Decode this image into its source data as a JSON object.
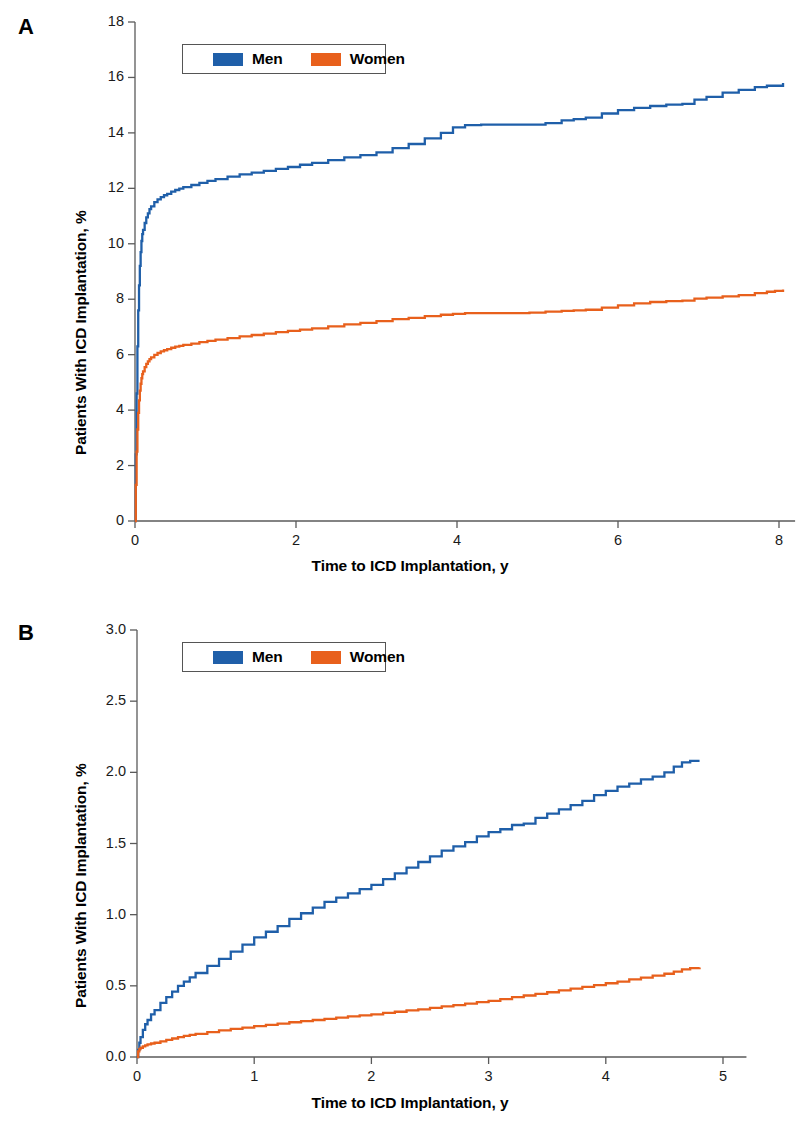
{
  "figure": {
    "background": "#ffffff",
    "series_colors": {
      "men": "#1f5fa9",
      "women": "#e8601c"
    },
    "axis_color": "#5a5a5a"
  },
  "panels": [
    {
      "letter": "A",
      "legend": {
        "entries": [
          {
            "label": "Men",
            "color": "#1f5fa9",
            "swatch_name": "legend-swatch-men"
          },
          {
            "label": "Women",
            "color": "#e8601c",
            "swatch_name": "legend-swatch-women"
          }
        ]
      },
      "chart_data": {
        "type": "line",
        "title": "",
        "xlabel": "Time to ICD Implantation, y",
        "ylabel": "Patients With ICD Implantation, %",
        "xlim": [
          0,
          8.2
        ],
        "ylim": [
          0,
          18
        ],
        "xticks": [
          0,
          2,
          4,
          6,
          8
        ],
        "xtick_labels": [
          "0",
          "2",
          "4",
          "6",
          "8"
        ],
        "yticks": [
          0,
          2,
          4,
          6,
          8,
          10,
          12,
          14,
          16,
          18
        ],
        "ytick_labels": [
          "0",
          "2",
          "4",
          "6",
          "8",
          "10",
          "12",
          "14",
          "16",
          "18"
        ],
        "grid": false,
        "legend_position": "top-center",
        "step_curves": true,
        "series": [
          {
            "name": "Men",
            "color": "#1f5fa9",
            "x": [
              0,
              0.01,
              0.02,
              0.03,
              0.04,
              0.05,
              0.06,
              0.07,
              0.08,
              0.09,
              0.1,
              0.12,
              0.14,
              0.16,
              0.18,
              0.2,
              0.24,
              0.28,
              0.32,
              0.36,
              0.4,
              0.45,
              0.5,
              0.55,
              0.6,
              0.7,
              0.8,
              0.9,
              1.0,
              1.15,
              1.3,
              1.45,
              1.6,
              1.75,
              1.9,
              2.05,
              2.2,
              2.4,
              2.6,
              2.8,
              3.0,
              3.2,
              3.4,
              3.6,
              3.8,
              3.95,
              4.1,
              4.3,
              4.5,
              4.7,
              4.9,
              5.1,
              5.3,
              5.45,
              5.6,
              5.8,
              6.0,
              6.2,
              6.4,
              6.6,
              6.8,
              6.95,
              7.1,
              7.3,
              7.5,
              7.7,
              7.85,
              7.95,
              8.05
            ],
            "y": [
              0,
              2.4,
              4.6,
              6.3,
              7.6,
              8.5,
              9.2,
              9.7,
              10.1,
              10.35,
              10.5,
              10.75,
              10.95,
              11.1,
              11.25,
              11.35,
              11.5,
              11.6,
              11.68,
              11.75,
              11.8,
              11.88,
              11.94,
              11.99,
              12.04,
              12.12,
              12.2,
              12.27,
              12.33,
              12.42,
              12.5,
              12.57,
              12.63,
              12.7,
              12.77,
              12.85,
              12.92,
              13.02,
              13.12,
              13.2,
              13.3,
              13.45,
              13.6,
              13.8,
              14.0,
              14.2,
              14.28,
              14.3,
              14.3,
              14.3,
              14.3,
              14.35,
              14.45,
              14.5,
              14.55,
              14.7,
              14.82,
              14.9,
              14.97,
              15.02,
              15.05,
              15.2,
              15.3,
              15.45,
              15.55,
              15.65,
              15.7,
              15.7,
              15.8
            ]
          },
          {
            "name": "Women",
            "color": "#e8601c",
            "x": [
              0,
              0.01,
              0.02,
              0.03,
              0.04,
              0.05,
              0.06,
              0.07,
              0.08,
              0.09,
              0.1,
              0.12,
              0.14,
              0.16,
              0.18,
              0.2,
              0.24,
              0.28,
              0.32,
              0.36,
              0.4,
              0.45,
              0.5,
              0.55,
              0.6,
              0.7,
              0.8,
              0.9,
              1.0,
              1.15,
              1.3,
              1.45,
              1.6,
              1.75,
              1.9,
              2.05,
              2.2,
              2.4,
              2.6,
              2.8,
              3.0,
              3.2,
              3.4,
              3.6,
              3.8,
              3.95,
              4.1,
              4.3,
              4.5,
              4.7,
              4.9,
              5.1,
              5.3,
              5.45,
              5.6,
              5.8,
              6.0,
              6.2,
              6.4,
              6.6,
              6.8,
              6.95,
              7.1,
              7.3,
              7.5,
              7.7,
              7.85,
              7.95,
              8.05
            ],
            "y": [
              0,
              1.3,
              2.5,
              3.3,
              3.9,
              4.35,
              4.7,
              4.95,
              5.15,
              5.3,
              5.4,
              5.55,
              5.67,
              5.76,
              5.84,
              5.9,
              5.99,
              6.06,
              6.12,
              6.16,
              6.2,
              6.25,
              6.29,
              6.32,
              6.35,
              6.4,
              6.45,
              6.5,
              6.54,
              6.6,
              6.66,
              6.71,
              6.76,
              6.81,
              6.86,
              6.9,
              6.95,
              7.02,
              7.09,
              7.15,
              7.21,
              7.28,
              7.33,
              7.39,
              7.44,
              7.47,
              7.5,
              7.5,
              7.5,
              7.5,
              7.52,
              7.55,
              7.58,
              7.6,
              7.62,
              7.7,
              7.78,
              7.85,
              7.9,
              7.93,
              7.95,
              8.02,
              8.06,
              8.1,
              8.15,
              8.22,
              8.27,
              8.3,
              8.35
            ]
          }
        ]
      }
    },
    {
      "letter": "B",
      "legend": {
        "entries": [
          {
            "label": "Men",
            "color": "#1f5fa9",
            "swatch_name": "legend-swatch-men"
          },
          {
            "label": "Women",
            "color": "#e8601c",
            "swatch_name": "legend-swatch-women"
          }
        ]
      },
      "chart_data": {
        "type": "line",
        "title": "",
        "xlabel": "Time to ICD Implantation, y",
        "ylabel": "Patients With ICD Implantation, %",
        "xlim": [
          0,
          5.2
        ],
        "ylim": [
          0,
          3.0
        ],
        "xticks": [
          0,
          1,
          2,
          3,
          4,
          5
        ],
        "xtick_labels": [
          "0",
          "1",
          "2",
          "3",
          "4",
          "5"
        ],
        "yticks": [
          0.0,
          0.5,
          1.0,
          1.5,
          2.0,
          2.5,
          3.0
        ],
        "ytick_labels": [
          "0.0",
          "0.5",
          "1.0",
          "1.5",
          "2.0",
          "2.5",
          "3.0"
        ],
        "grid": false,
        "legend_position": "top-center",
        "step_curves": true,
        "series": [
          {
            "name": "Men",
            "color": "#1f5fa9",
            "x": [
              0,
              0.01,
              0.02,
              0.03,
              0.05,
              0.07,
              0.09,
              0.12,
              0.15,
              0.2,
              0.25,
              0.3,
              0.35,
              0.4,
              0.45,
              0.5,
              0.6,
              0.7,
              0.8,
              0.9,
              1.0,
              1.1,
              1.2,
              1.3,
              1.4,
              1.5,
              1.6,
              1.7,
              1.8,
              1.9,
              2.0,
              2.1,
              2.2,
              2.3,
              2.4,
              2.5,
              2.6,
              2.7,
              2.8,
              2.9,
              3.0,
              3.1,
              3.2,
              3.3,
              3.4,
              3.5,
              3.6,
              3.7,
              3.8,
              3.9,
              4.0,
              4.1,
              4.2,
              4.3,
              4.4,
              4.5,
              4.58,
              4.65,
              4.72,
              4.8
            ],
            "y": [
              0,
              0.05,
              0.1,
              0.14,
              0.19,
              0.23,
              0.26,
              0.3,
              0.33,
              0.38,
              0.42,
              0.46,
              0.5,
              0.53,
              0.56,
              0.59,
              0.64,
              0.69,
              0.74,
              0.79,
              0.84,
              0.88,
              0.92,
              0.97,
              1.01,
              1.05,
              1.09,
              1.12,
              1.15,
              1.18,
              1.21,
              1.25,
              1.29,
              1.33,
              1.37,
              1.41,
              1.45,
              1.48,
              1.51,
              1.55,
              1.58,
              1.6,
              1.63,
              1.64,
              1.68,
              1.71,
              1.74,
              1.77,
              1.8,
              1.84,
              1.87,
              1.9,
              1.92,
              1.95,
              1.97,
              2.0,
              2.04,
              2.07,
              2.08,
              2.08
            ]
          },
          {
            "name": "Women",
            "color": "#e8601c",
            "x": [
              0,
              0.01,
              0.02,
              0.03,
              0.05,
              0.07,
              0.09,
              0.12,
              0.15,
              0.2,
              0.25,
              0.3,
              0.35,
              0.4,
              0.45,
              0.5,
              0.6,
              0.7,
              0.8,
              0.9,
              1.0,
              1.1,
              1.2,
              1.3,
              1.4,
              1.5,
              1.6,
              1.7,
              1.8,
              1.9,
              2.0,
              2.1,
              2.2,
              2.3,
              2.4,
              2.5,
              2.6,
              2.7,
              2.8,
              2.9,
              3.0,
              3.1,
              3.2,
              3.3,
              3.4,
              3.5,
              3.6,
              3.7,
              3.8,
              3.9,
              4.0,
              4.1,
              4.2,
              4.3,
              4.4,
              4.5,
              4.58,
              4.65,
              4.72,
              4.8
            ],
            "y": [
              0,
              0.04,
              0.055,
              0.065,
              0.075,
              0.082,
              0.088,
              0.095,
              0.1,
              0.11,
              0.12,
              0.13,
              0.14,
              0.148,
              0.155,
              0.162,
              0.175,
              0.187,
              0.197,
              0.207,
              0.217,
              0.226,
              0.235,
              0.244,
              0.252,
              0.26,
              0.268,
              0.277,
              0.285,
              0.293,
              0.3,
              0.31,
              0.318,
              0.327,
              0.335,
              0.345,
              0.355,
              0.365,
              0.375,
              0.385,
              0.395,
              0.407,
              0.42,
              0.432,
              0.443,
              0.455,
              0.468,
              0.48,
              0.492,
              0.505,
              0.518,
              0.53,
              0.545,
              0.558,
              0.572,
              0.585,
              0.6,
              0.615,
              0.625,
              0.628
            ]
          }
        ]
      }
    }
  ]
}
